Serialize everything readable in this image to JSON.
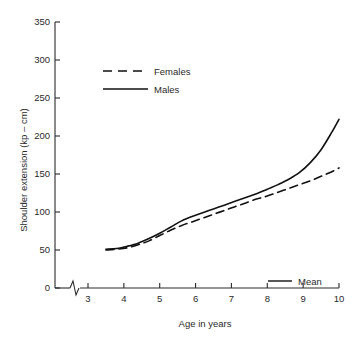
{
  "chart_data": {
    "type": "line",
    "title": "",
    "xlabel": "Age in years",
    "ylabel": "Shoulder extension (kp – cm)",
    "xlim": [
      3,
      10
    ],
    "ylim": [
      0,
      350
    ],
    "xticks": [
      3,
      4,
      5,
      6,
      7,
      8,
      9,
      10
    ],
    "yticks": [
      0,
      50,
      100,
      150,
      200,
      250,
      300,
      350
    ],
    "xtick_labels": [
      "3",
      "4",
      "5",
      "6",
      "7",
      "8",
      "9",
      "10"
    ],
    "ytick_labels": [
      "0",
      "50",
      "100",
      "150",
      "200",
      "250",
      "300",
      "350"
    ],
    "grid": false,
    "axis_break_x": true,
    "legend_position": "upper-left-inside",
    "annotations": [
      {
        "name": "mean-note",
        "label": "Mean",
        "style": "solid"
      }
    ],
    "series": [
      {
        "name": "Females",
        "style": "dashed",
        "color": "#111111",
        "x": [
          3.5,
          3.8,
          4.1,
          4.4,
          4.7,
          5.0,
          5.3,
          5.6,
          5.9,
          6.2,
          6.5,
          6.8,
          7.1,
          7.4,
          7.7,
          8.0,
          8.3,
          8.6,
          8.9,
          9.2,
          9.5,
          9.8,
          10.0
        ],
        "y": [
          50,
          51,
          53,
          57,
          62,
          69,
          76,
          82,
          87,
          92,
          97,
          102,
          107,
          112,
          117,
          121,
          126,
          131,
          136,
          141,
          147,
          153,
          158
        ]
      },
      {
        "name": "Males",
        "style": "solid",
        "color": "#111111",
        "x": [
          3.5,
          3.8,
          4.1,
          4.4,
          4.7,
          5.0,
          5.3,
          5.6,
          5.9,
          6.2,
          6.5,
          6.8,
          7.1,
          7.4,
          7.7,
          8.0,
          8.3,
          8.6,
          8.9,
          9.2,
          9.5,
          9.8,
          10.0
        ],
        "y": [
          51,
          52,
          55,
          59,
          65,
          72,
          80,
          88,
          94,
          99,
          104,
          109,
          114,
          119,
          124,
          130,
          136,
          143,
          152,
          165,
          182,
          205,
          222
        ]
      }
    ]
  },
  "legend": {
    "entries": [
      {
        "label": "Females",
        "style": "dashed"
      },
      {
        "label": "Males",
        "style": "solid"
      }
    ]
  }
}
